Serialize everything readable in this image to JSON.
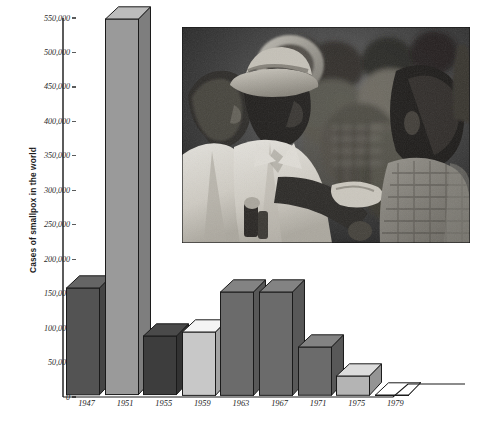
{
  "chart_data": {
    "type": "bar",
    "title": "",
    "xlabel": "",
    "ylabel": "Cases of smallpox in the world",
    "categories": [
      "1947",
      "1951",
      "1955",
      "1959",
      "1963",
      "1967",
      "1971",
      "1975",
      "1979"
    ],
    "values": [
      155000,
      545000,
      85000,
      92000,
      150000,
      150000,
      70000,
      28000,
      0
    ],
    "ylim": [
      0,
      550000
    ],
    "ytick_labels": [
      "550,000",
      "500,000",
      "450,000",
      "400,000",
      "350,000",
      "300,000",
      "250,000",
      "200,000",
      "150,000",
      "100,000",
      "50,000",
      "0"
    ],
    "ytick_values": [
      550000,
      500000,
      450000,
      400000,
      350000,
      300000,
      250000,
      200000,
      150000,
      100000,
      50000,
      0
    ],
    "grid": false,
    "legend": "none",
    "bar_style": "3d",
    "bar_colors": [
      "#535353",
      "#9a9a9a",
      "#3d3d3d",
      "#c8c8c8",
      "#6b6b6b",
      "#6b6b6b",
      "#6b6b6b",
      "#b4b4b4",
      "#ffffff"
    ]
  },
  "chart": {
    "y_axis_title": "Cases of smallpox in the world",
    "axis_color": "#5b5b5b",
    "outline_color": "#1a1a1a",
    "background": "#ffffff"
  },
  "photo": {
    "caption": "",
    "alt_name": "smallpox-campaign-photograph",
    "description": "Black and white photograph of a crowd of people, a man in a hat speaking with another man"
  }
}
